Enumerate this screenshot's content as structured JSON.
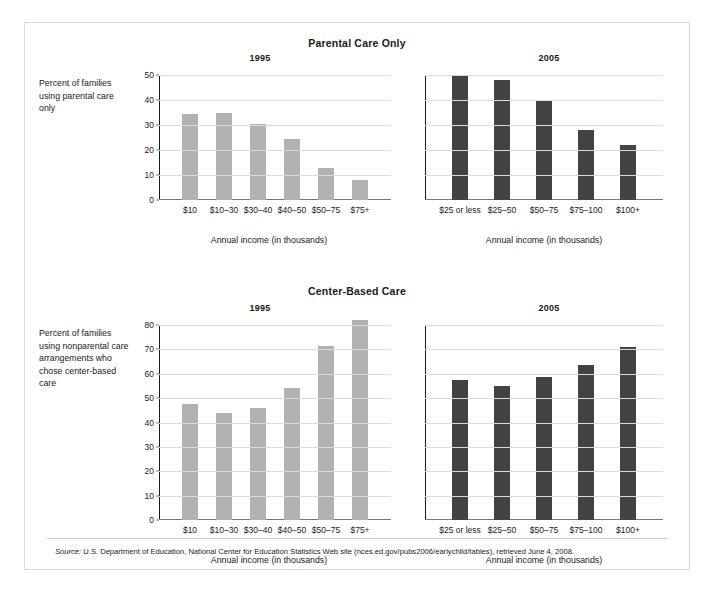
{
  "figure": {
    "source_label": "Source:",
    "source_text": " U.S. Department of Education, National Center for Education Statistics Web site (nces.ed.gov/pubs2006/earlychild/tables), retrieved June 4, 2008."
  },
  "charts": {
    "parental": {
      "title": "Parental Care Only",
      "ylabel": "Percent of families using parental care only",
      "xlabel": "Annual income (in thousands)",
      "panels": [
        {
          "year": "1995",
          "color": "#b2b2b2"
        },
        {
          "year": "2005",
          "color": "#434343"
        }
      ]
    },
    "center": {
      "title": "Center-Based Care",
      "ylabel": "Percent of families using nonparental care arrangements who chose center-based care",
      "xlabel": "Annual income (in thousands)",
      "panels": [
        {
          "year": "1995",
          "color": "#b2b2b2"
        },
        {
          "year": "2005",
          "color": "#434343"
        }
      ]
    }
  },
  "chart_data": [
    {
      "type": "bar",
      "title": "Parental Care Only",
      "panel": "1995",
      "xlabel": "Annual income (in thousands)",
      "ylabel": "Percent of families using parental care only",
      "categories": [
        "$10",
        "$10–30",
        "$30–40",
        "$40–50",
        "$50–75",
        "$75+"
      ],
      "values": [
        34.5,
        35,
        30.5,
        24.5,
        13,
        8
      ],
      "ylim": [
        0,
        50
      ],
      "yticks": [
        0,
        10,
        20,
        30,
        40,
        50
      ],
      "bar_color": "#b2b2b2",
      "grid": true,
      "legend": "none"
    },
    {
      "type": "bar",
      "title": "Parental Care Only",
      "panel": "2005",
      "xlabel": "Annual income (in thousands)",
      "ylabel": "Percent of families using parental care only",
      "categories": [
        "$25 or less",
        "$25–50",
        "$50–75",
        "$75–100",
        "$100+"
      ],
      "values": [
        50,
        48,
        40,
        28,
        22
      ],
      "ylim": [
        0,
        50
      ],
      "yticks": [
        0,
        10,
        20,
        30,
        40,
        50
      ],
      "bar_color": "#434343",
      "grid": true,
      "legend": "none"
    },
    {
      "type": "bar",
      "title": "Center-Based Care",
      "panel": "1995",
      "xlabel": "Annual income (in thousands)",
      "ylabel": "Percent of families using nonparental care arrangements who chose center-based care",
      "categories": [
        "$10",
        "$10–30",
        "$30–40",
        "$40–50",
        "$50–75",
        "$75+"
      ],
      "values": [
        47.5,
        44,
        46,
        54,
        71.5,
        82
      ],
      "ylim": [
        0,
        80
      ],
      "yticks": [
        0,
        10,
        20,
        30,
        40,
        50,
        60,
        70,
        80
      ],
      "bar_color": "#b2b2b2",
      "grid": true,
      "legend": "none"
    },
    {
      "type": "bar",
      "title": "Center-Based Care",
      "panel": "2005",
      "xlabel": "Annual income (in thousands)",
      "ylabel": "Percent of families using nonparental care arrangements who chose center-based care",
      "categories": [
        "$25 or less",
        "$25–50",
        "$50–75",
        "$75–100",
        "$100+"
      ],
      "values": [
        57.5,
        55,
        58.5,
        63.5,
        71
      ],
      "ylim": [
        0,
        80
      ],
      "yticks": [
        0,
        10,
        20,
        30,
        40,
        50,
        60,
        70,
        80
      ],
      "bar_color": "#434343",
      "grid": true,
      "legend": "none"
    }
  ]
}
